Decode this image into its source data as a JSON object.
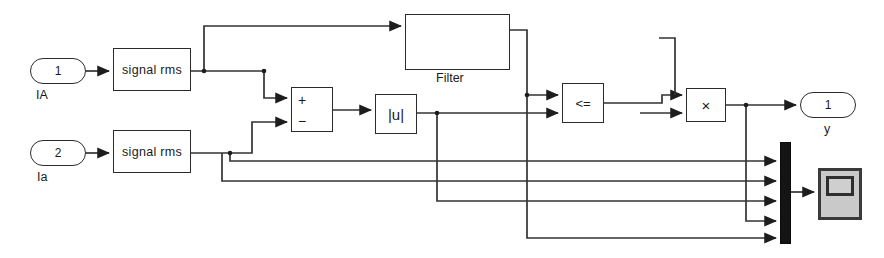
{
  "diagram": {
    "kind": "simulink-block-diagram",
    "canvas": {
      "width": 884,
      "height": 258,
      "background": "#ffffff"
    },
    "wire_color": "#333333",
    "inports": [
      {
        "name": "inport-ia-upper",
        "number": "1",
        "label": "IA",
        "x": 30,
        "y": 58,
        "w": 56,
        "h": 26
      },
      {
        "name": "inport-ia-lower",
        "number": "2",
        "label": "Ia",
        "x": 30,
        "y": 140,
        "w": 56,
        "h": 26
      }
    ],
    "outports": [
      {
        "name": "outport-y",
        "number": "1",
        "label": "y",
        "x": 800,
        "y": 88,
        "w": 56,
        "h": 26
      }
    ],
    "blocks": [
      {
        "name": "signal-rms-upper",
        "label": "signal rms",
        "x": 113,
        "y": 48,
        "w": 78,
        "h": 43
      },
      {
        "name": "signal-rms-lower",
        "label": "signal rms",
        "x": 113,
        "y": 130,
        "w": 78,
        "h": 43
      },
      {
        "name": "filter-block",
        "label": "",
        "caption": "Filter",
        "x": 405,
        "y": 14,
        "w": 105,
        "h": 56
      },
      {
        "name": "abs-block",
        "label": "|u|",
        "x": 375,
        "y": 94,
        "w": 42,
        "h": 40
      },
      {
        "name": "relational-operator-block",
        "label": "<=",
        "x": 562,
        "y": 83,
        "w": 42,
        "h": 40
      },
      {
        "name": "product-block",
        "label": "×",
        "x": 686,
        "y": 88,
        "w": 40,
        "h": 34
      }
    ],
    "sum_block": {
      "name": "sum-block",
      "x": 291,
      "y": 87,
      "w": 42,
      "h": 45,
      "plus_sign": "+",
      "minus_sign": "−"
    },
    "mux": {
      "name": "mux-block",
      "x": 780,
      "y": 142,
      "w": 9,
      "h": 100,
      "inputs": 5
    },
    "scope": {
      "name": "scope-block",
      "x": 818,
      "y": 168,
      "w": 44,
      "h": 52
    },
    "signals": [
      {
        "name": "signal-ia-to-rms-upper",
        "from": "inport-ia-upper",
        "to": "signal-rms-upper"
      },
      {
        "name": "signal-ia-to-rms-lower",
        "from": "inport-ia-lower",
        "to": "signal-rms-lower"
      },
      {
        "name": "signal-rms-upper-to-filter",
        "from": "signal-rms-upper",
        "to": "filter-block"
      },
      {
        "name": "signal-rms-upper-to-sum-plus",
        "from": "signal-rms-upper",
        "to": "sum-block-plus"
      },
      {
        "name": "signal-rms-lower-to-sum-minus",
        "from": "signal-rms-lower",
        "to": "sum-block-minus"
      },
      {
        "name": "signal-rms-lower-to-mux",
        "from": "signal-rms-lower",
        "to": "mux-block"
      },
      {
        "name": "signal-sum-to-abs",
        "from": "sum-block",
        "to": "abs-block"
      },
      {
        "name": "signal-abs-to-relational",
        "from": "abs-block",
        "to": "relational-operator-block"
      },
      {
        "name": "signal-abs-to-mux",
        "from": "abs-block",
        "to": "mux-block"
      },
      {
        "name": "signal-filter-to-relational",
        "from": "filter-block",
        "to": "relational-operator-block"
      },
      {
        "name": "signal-filter-to-mux",
        "from": "filter-block",
        "to": "mux-block"
      },
      {
        "name": "signal-relational-to-product",
        "from": "relational-operator-block",
        "to": "product-block"
      },
      {
        "name": "signal-product-to-outport",
        "from": "product-block",
        "to": "outport-y"
      },
      {
        "name": "signal-product-to-mux",
        "from": "product-block",
        "to": "mux-block"
      },
      {
        "name": "signal-mux-to-scope",
        "from": "mux-block",
        "to": "scope-block"
      }
    ]
  }
}
